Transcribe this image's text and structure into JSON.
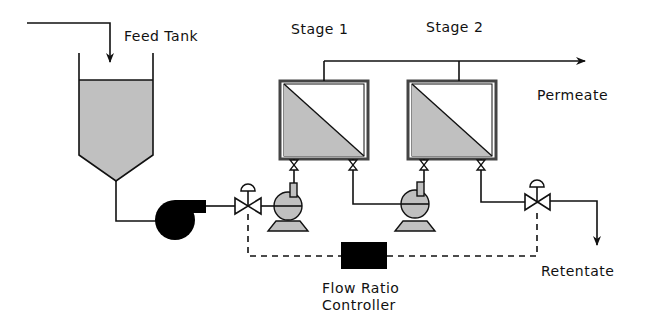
{
  "diagram": {
    "type": "process-flow",
    "labels": {
      "feed_tank": "Feed Tank",
      "stage1": "Stage 1",
      "stage2": "Stage 2",
      "permeate": "Permeate",
      "retentate": "Retentate",
      "controller_line1": "Flow Ratio",
      "controller_line2": "Controller"
    },
    "components": [
      {
        "id": "feed-tank",
        "kind": "tank"
      },
      {
        "id": "feed-pump",
        "kind": "centrifugal-pump",
        "fill": "black"
      },
      {
        "id": "control-valve-1",
        "kind": "control-valve"
      },
      {
        "id": "pump-1",
        "kind": "centrifugal-pump",
        "fill": "gray"
      },
      {
        "id": "membrane-stage-1",
        "kind": "membrane-module"
      },
      {
        "id": "pump-2",
        "kind": "centrifugal-pump",
        "fill": "gray"
      },
      {
        "id": "membrane-stage-2",
        "kind": "membrane-module"
      },
      {
        "id": "control-valve-2",
        "kind": "control-valve"
      },
      {
        "id": "flow-ratio-controller",
        "kind": "controller"
      }
    ],
    "colors": {
      "line": "#111111",
      "fill_gray": "#c0c0c0",
      "fill_black": "#000000"
    }
  }
}
